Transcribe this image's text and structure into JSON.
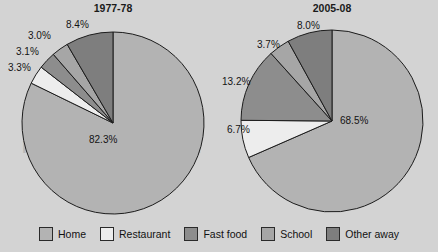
{
  "watermark": {
    "text": "FreeTestOnline.com"
  },
  "legend": {
    "position": "bottom",
    "items": [
      {
        "label": "Home",
        "color": "#b3b3b3"
      },
      {
        "label": "Restaurant",
        "color": "#ededed"
      },
      {
        "label": "Fast food",
        "color": "#8d8d8d"
      },
      {
        "label": "School",
        "color": "#a6a6a6"
      },
      {
        "label": "Other away",
        "color": "#7e7e7e"
      }
    ]
  },
  "charts": [
    {
      "id": "pie-1977-78",
      "title": "1977-78",
      "labels": {
        "home": "82.3%",
        "restaurant": "3.3%",
        "fast_food": "3.1%",
        "school": "3.0%",
        "other_away": "8.4%"
      }
    },
    {
      "id": "pie-2005-08",
      "title": "2005-08",
      "labels": {
        "home": "68.5%",
        "restaurant": "6.7%",
        "fast_food": "13.2%",
        "school": "3.7%",
        "other_away": "8.0%"
      }
    }
  ],
  "chart_data": [
    {
      "type": "pie",
      "title": "1977-78",
      "categories": [
        "Home",
        "Restaurant",
        "Fast food",
        "School",
        "Other away"
      ],
      "values": [
        82.3,
        3.3,
        3.1,
        3.0,
        8.4
      ],
      "value_labels": [
        "82.3%",
        "3.3%",
        "3.1%",
        "3.0%",
        "8.4%"
      ],
      "colors": [
        "#b3b3b3",
        "#ededed",
        "#8d8d8d",
        "#a6a6a6",
        "#7e7e7e"
      ],
      "start_angle_deg": 0,
      "direction": "clockwise",
      "legend": "bottom-shared",
      "grid": false,
      "xlabel": "",
      "ylabel": ""
    },
    {
      "type": "pie",
      "title": "2005-08",
      "categories": [
        "Home",
        "Restaurant",
        "Fast food",
        "School",
        "Other away"
      ],
      "values": [
        68.5,
        6.7,
        13.2,
        3.7,
        8.0
      ],
      "value_labels": [
        "68.5%",
        "6.7%",
        "13.2%",
        "3.7%",
        "8.0%"
      ],
      "colors": [
        "#b3b3b3",
        "#ededed",
        "#8d8d8d",
        "#a6a6a6",
        "#7e7e7e"
      ],
      "start_angle_deg": 0,
      "direction": "clockwise",
      "legend": "bottom-shared",
      "grid": false,
      "xlabel": "",
      "ylabel": ""
    }
  ]
}
